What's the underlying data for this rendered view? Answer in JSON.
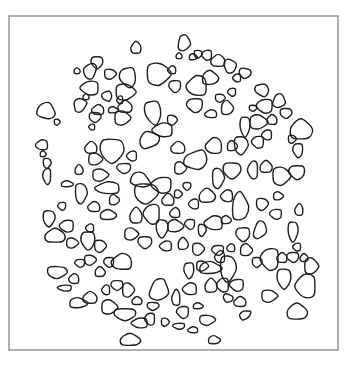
{
  "figure": {
    "frame": {
      "x": 9,
      "y": 16,
      "width": 329,
      "height": 334,
      "stroke": "#7a7a7a"
    },
    "blob_stroke": "#1e1e1e",
    "blobs": [
      [
        136,
        48,
        5,
        6,
        0
      ],
      [
        184,
        43,
        6,
        8,
        10
      ],
      [
        97,
        62,
        6,
        6,
        0
      ],
      [
        90,
        71,
        6,
        8,
        20
      ],
      [
        77,
        71,
        3,
        3,
        0
      ],
      [
        110,
        74,
        6,
        5,
        0
      ],
      [
        128,
        77,
        8,
        10,
        -10
      ],
      [
        172,
        70,
        4,
        4,
        0
      ],
      [
        193,
        57,
        4,
        3,
        0
      ],
      [
        198,
        54,
        4,
        4,
        0
      ],
      [
        207,
        55,
        5,
        5,
        0
      ],
      [
        218,
        61,
        7,
        6,
        0
      ],
      [
        230,
        66,
        6,
        7,
        -20
      ],
      [
        245,
        73,
        6,
        5,
        10
      ],
      [
        237,
        78,
        4,
        4,
        0
      ],
      [
        179,
        56,
        3,
        3,
        0
      ],
      [
        158,
        74,
        12,
        11,
        0
      ],
      [
        175,
        86,
        6,
        6,
        0
      ],
      [
        197,
        86,
        10,
        10,
        0
      ],
      [
        210,
        78,
        8,
        7,
        0
      ],
      [
        220,
        98,
        5,
        4,
        0
      ],
      [
        232,
        92,
        4,
        4,
        0
      ],
      [
        262,
        90,
        7,
        6,
        30
      ],
      [
        279,
        101,
        6,
        7,
        20
      ],
      [
        286,
        113,
        6,
        5,
        0
      ],
      [
        90,
        88,
        9,
        7,
        0
      ],
      [
        86,
        97,
        3,
        3,
        0
      ],
      [
        125,
        92,
        10,
        8,
        0
      ],
      [
        107,
        96,
        5,
        5,
        -20
      ],
      [
        120,
        100,
        3,
        4,
        0
      ],
      [
        46,
        111,
        9,
        8,
        20
      ],
      [
        57,
        122,
        3,
        3,
        0
      ],
      [
        80,
        105,
        6,
        7,
        30
      ],
      [
        98,
        110,
        6,
        5,
        0
      ],
      [
        113,
        110,
        5,
        3,
        0
      ],
      [
        95,
        117,
        6,
        5,
        0
      ],
      [
        92,
        127,
        3,
        3,
        0
      ],
      [
        125,
        107,
        7,
        6,
        0
      ],
      [
        122,
        118,
        8,
        7,
        0
      ],
      [
        153,
        112,
        8,
        12,
        -10
      ],
      [
        163,
        130,
        10,
        7,
        0
      ],
      [
        149,
        140,
        10,
        8,
        -20
      ],
      [
        172,
        120,
        5,
        5,
        0
      ],
      [
        195,
        105,
        8,
        7,
        0
      ],
      [
        211,
        114,
        6,
        4,
        0
      ],
      [
        227,
        108,
        6,
        7,
        0
      ],
      [
        253,
        108,
        4,
        3,
        0
      ],
      [
        265,
        106,
        8,
        7,
        0
      ],
      [
        272,
        120,
        5,
        5,
        0
      ],
      [
        258,
        122,
        9,
        7,
        0
      ],
      [
        245,
        126,
        5,
        10,
        0
      ],
      [
        267,
        135,
        5,
        5,
        0
      ],
      [
        301,
        130,
        11,
        10,
        0
      ],
      [
        292,
        139,
        4,
        4,
        0
      ],
      [
        298,
        150,
        5,
        7,
        0
      ],
      [
        42,
        145,
        6,
        5,
        0
      ],
      [
        43,
        154,
        3,
        3,
        0
      ],
      [
        47,
        163,
        4,
        5,
        0
      ],
      [
        47,
        176,
        4,
        8,
        0
      ],
      [
        91,
        148,
        6,
        6,
        0
      ],
      [
        95,
        159,
        7,
        6,
        0
      ],
      [
        112,
        150,
        12,
        12,
        0
      ],
      [
        132,
        156,
        5,
        5,
        0
      ],
      [
        79,
        170,
        4,
        5,
        0
      ],
      [
        100,
        175,
        8,
        6,
        0
      ],
      [
        124,
        168,
        7,
        5,
        0
      ],
      [
        108,
        188,
        12,
        6,
        0
      ],
      [
        67,
        184,
        6,
        3,
        0
      ],
      [
        81,
        193,
        6,
        10,
        0
      ],
      [
        62,
        206,
        4,
        4,
        0
      ],
      [
        94,
        207,
        6,
        5,
        0
      ],
      [
        114,
        200,
        5,
        5,
        0
      ],
      [
        49,
        218,
        6,
        8,
        0
      ],
      [
        67,
        226,
        7,
        6,
        0
      ],
      [
        55,
        236,
        10,
        7,
        0
      ],
      [
        72,
        243,
        6,
        5,
        0
      ],
      [
        88,
        240,
        7,
        9,
        0
      ],
      [
        90,
        228,
        4,
        4,
        0
      ],
      [
        108,
        215,
        8,
        5,
        0
      ],
      [
        100,
        246,
        6,
        6,
        0
      ],
      [
        109,
        262,
        5,
        5,
        0
      ],
      [
        122,
        262,
        10,
        8,
        0
      ],
      [
        140,
        180,
        10,
        7,
        20
      ],
      [
        146,
        193,
        12,
        10,
        0
      ],
      [
        162,
        185,
        10,
        8,
        0
      ],
      [
        168,
        200,
        6,
        6,
        0
      ],
      [
        178,
        194,
        4,
        4,
        0
      ],
      [
        187,
        186,
        4,
        4,
        0
      ],
      [
        194,
        204,
        5,
        5,
        0
      ],
      [
        207,
        196,
        8,
        7,
        0
      ],
      [
        218,
        178,
        6,
        10,
        0
      ],
      [
        196,
        160,
        12,
        9,
        -20
      ],
      [
        214,
        146,
        8,
        8,
        0
      ],
      [
        232,
        146,
        5,
        5,
        0
      ],
      [
        241,
        145,
        7,
        9,
        0
      ],
      [
        258,
        142,
        6,
        6,
        0
      ],
      [
        178,
        148,
        7,
        6,
        0
      ],
      [
        180,
        168,
        6,
        6,
        0
      ],
      [
        232,
        170,
        9,
        8,
        0
      ],
      [
        253,
        170,
        5,
        9,
        0
      ],
      [
        266,
        167,
        6,
        6,
        0
      ],
      [
        281,
        176,
        9,
        9,
        0
      ],
      [
        297,
        172,
        8,
        7,
        0
      ],
      [
        227,
        196,
        6,
        6,
        0
      ],
      [
        240,
        207,
        8,
        14,
        0
      ],
      [
        262,
        204,
        6,
        6,
        0
      ],
      [
        276,
        214,
        6,
        5,
        0
      ],
      [
        299,
        210,
        4,
        6,
        0
      ],
      [
        278,
        196,
        5,
        4,
        0
      ],
      [
        293,
        231,
        5,
        10,
        0
      ],
      [
        297,
        247,
        4,
        4,
        0
      ],
      [
        304,
        258,
        4,
        4,
        0
      ],
      [
        260,
        230,
        6,
        9,
        20
      ],
      [
        243,
        234,
        7,
        7,
        0
      ],
      [
        214,
        223,
        9,
        7,
        0
      ],
      [
        226,
        220,
        5,
        4,
        0
      ],
      [
        202,
        230,
        4,
        6,
        0
      ],
      [
        190,
        224,
        5,
        5,
        0
      ],
      [
        175,
        213,
        5,
        5,
        0
      ],
      [
        175,
        226,
        8,
        6,
        0
      ],
      [
        162,
        228,
        6,
        9,
        0
      ],
      [
        152,
        214,
        8,
        10,
        0
      ],
      [
        136,
        216,
        6,
        8,
        0
      ],
      [
        131,
        234,
        7,
        6,
        0
      ],
      [
        145,
        242,
        7,
        6,
        0
      ],
      [
        166,
        246,
        6,
        5,
        0
      ],
      [
        183,
        244,
        5,
        6,
        0
      ],
      [
        198,
        249,
        6,
        6,
        0
      ],
      [
        218,
        250,
        6,
        5,
        0
      ],
      [
        231,
        248,
        4,
        4,
        0
      ],
      [
        246,
        250,
        6,
        6,
        0
      ],
      [
        257,
        262,
        5,
        5,
        0
      ],
      [
        270,
        259,
        9,
        11,
        0
      ],
      [
        282,
        258,
        5,
        5,
        0
      ],
      [
        311,
        266,
        7,
        8,
        0
      ],
      [
        284,
        278,
        7,
        10,
        0
      ],
      [
        306,
        286,
        10,
        12,
        0
      ],
      [
        297,
        312,
        10,
        8,
        0
      ],
      [
        269,
        296,
        8,
        6,
        0
      ],
      [
        293,
        257,
        6,
        5,
        0
      ],
      [
        220,
        257,
        5,
        6,
        0
      ],
      [
        210,
        268,
        11,
        6,
        0
      ],
      [
        228,
        268,
        8,
        13,
        0
      ],
      [
        237,
        285,
        7,
        6,
        0
      ],
      [
        240,
        302,
        6,
        5,
        0
      ],
      [
        245,
        315,
        6,
        4,
        -30
      ],
      [
        228,
        298,
        5,
        4,
        20
      ],
      [
        223,
        285,
        6,
        7,
        0
      ],
      [
        211,
        286,
        6,
        7,
        0
      ],
      [
        202,
        266,
        6,
        5,
        0
      ],
      [
        189,
        270,
        5,
        8,
        0
      ],
      [
        190,
        289,
        7,
        6,
        0
      ],
      [
        198,
        306,
        5,
        3,
        0
      ],
      [
        207,
        320,
        8,
        5,
        0
      ],
      [
        183,
        312,
        6,
        6,
        0
      ],
      [
        176,
        298,
        4,
        8,
        0
      ],
      [
        159,
        290,
        9,
        11,
        20
      ],
      [
        153,
        306,
        6,
        4,
        0
      ],
      [
        150,
        319,
        5,
        6,
        0
      ],
      [
        137,
        301,
        5,
        4,
        0
      ],
      [
        128,
        290,
        6,
        7,
        0
      ],
      [
        117,
        285,
        6,
        5,
        0
      ],
      [
        106,
        290,
        4,
        5,
        0
      ],
      [
        100,
        272,
        5,
        5,
        0
      ],
      [
        90,
        260,
        6,
        5,
        0
      ],
      [
        80,
        263,
        5,
        4,
        0
      ],
      [
        74,
        279,
        5,
        5,
        0
      ],
      [
        78,
        303,
        9,
        5,
        0
      ],
      [
        57,
        272,
        10,
        6,
        0
      ],
      [
        65,
        288,
        7,
        3,
        0
      ],
      [
        90,
        298,
        7,
        6,
        0
      ],
      [
        109,
        307,
        8,
        7,
        0
      ],
      [
        125,
        314,
        11,
        6,
        0
      ],
      [
        140,
        323,
        8,
        5,
        0
      ],
      [
        130,
        340,
        10,
        6,
        0
      ],
      [
        165,
        322,
        4,
        4,
        0
      ],
      [
        179,
        326,
        6,
        3,
        0
      ],
      [
        193,
        330,
        5,
        3,
        0
      ],
      [
        214,
        340,
        6,
        4,
        0
      ]
    ]
  }
}
